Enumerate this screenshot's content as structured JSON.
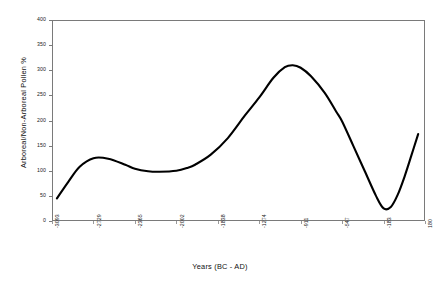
{
  "chart_data": {
    "type": "line",
    "title": "",
    "xlabel": "Years (BC - AD)",
    "ylabel": "Arboreal/Non-Arboreal Pollen %",
    "xlim": [
      -3093,
      180
    ],
    "ylim": [
      0,
      400
    ],
    "ytick_step": 50,
    "grid": false,
    "legend": "none",
    "line_color": "#000000",
    "frame_color": "#7a7a7a",
    "background": "#ffffff",
    "xticklabels": [
      "-3093",
      "-2729",
      "-2365",
      "-2002",
      "-1838",
      "-1274",
      "-911",
      "-547",
      "-183",
      "180"
    ],
    "yticklabels": [
      "0",
      "50",
      "100",
      "150",
      "200",
      "250",
      "300",
      "350",
      "400"
    ],
    "series": [
      {
        "name": "Arboreal/Non-Arboreal Pollen %",
        "x": [
          -3050,
          -2950,
          -2850,
          -2729,
          -2600,
          -2450,
          -2365,
          -2250,
          -2150,
          -2002,
          -1900,
          -1838,
          -1700,
          -1550,
          -1400,
          -1274,
          -1150,
          -1050,
          -980,
          -911,
          -820,
          -700,
          -600,
          -547,
          -450,
          -350,
          -250,
          -183,
          -120,
          -60,
          0,
          60,
          120
        ],
        "y": [
          45,
          78,
          108,
          125,
          124,
          112,
          104,
          99,
          98,
          100,
          106,
          112,
          132,
          165,
          210,
          246,
          285,
          306,
          310,
          305,
          288,
          255,
          218,
          198,
          150,
          100,
          50,
          25,
          28,
          52,
          88,
          130,
          173
        ]
      }
    ],
    "annotations": []
  },
  "axis": {
    "x_title": "Years (BC - AD)",
    "y_title": "Arboreal/Non-Arboreal Pollen %"
  }
}
